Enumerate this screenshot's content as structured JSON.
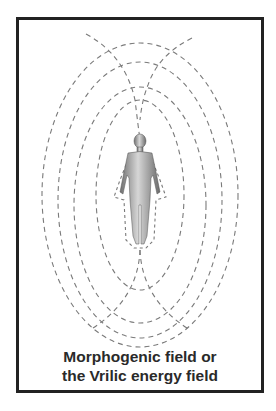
{
  "diagram": {
    "caption_line1": "Morphogenic field or",
    "caption_line2": "the Vrilic energy field",
    "elements": [
      "human-figure",
      "concentric-dashed-field-lines"
    ],
    "colors": {
      "frame": "#222222",
      "lines": "#777777",
      "figure": "#888888"
    }
  }
}
